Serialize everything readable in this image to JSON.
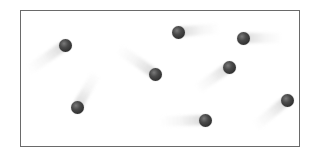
{
  "scene": {
    "description": "Particles with motion trails inside a rectangular container",
    "container": {
      "x": 20,
      "y": 10,
      "width": 279,
      "height": 136,
      "border_color": "#6a6a6a"
    },
    "ball_color": "#333333",
    "trail_color": "#bbbbbb",
    "particles": [
      {
        "x": 65,
        "y": 45,
        "trail_angle_deg": 145,
        "trail_length": 45
      },
      {
        "x": 178,
        "y": 32,
        "trail_angle_deg": -5,
        "trail_length": 42
      },
      {
        "x": 243,
        "y": 38,
        "trail_angle_deg": 0,
        "trail_length": 40
      },
      {
        "x": 155,
        "y": 74,
        "trail_angle_deg": -145,
        "trail_length": 45
      },
      {
        "x": 229,
        "y": 67,
        "trail_angle_deg": 145,
        "trail_length": 40
      },
      {
        "x": 77,
        "y": 107,
        "trail_angle_deg": -60,
        "trail_length": 40
      },
      {
        "x": 205,
        "y": 120,
        "trail_angle_deg": 178,
        "trail_length": 45
      },
      {
        "x": 287,
        "y": 100,
        "trail_angle_deg": 140,
        "trail_length": 42
      }
    ]
  }
}
